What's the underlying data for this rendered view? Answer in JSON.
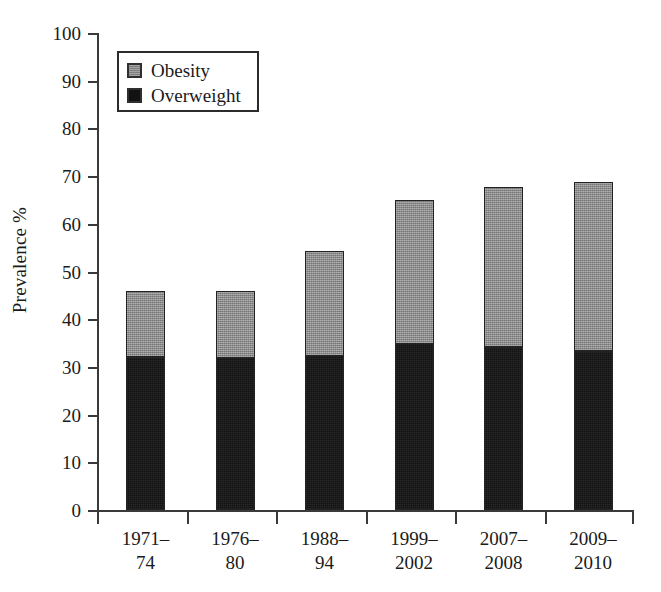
{
  "chart_data": {
    "type": "bar",
    "subtype": "stacked-vertical",
    "title": "",
    "xlabel": "",
    "ylabel": "Prevalence %",
    "ylim": [
      0,
      100
    ],
    "ytick_step": 10,
    "ytick_labels": [
      "0",
      "10",
      "20",
      "30",
      "40",
      "50",
      "60",
      "70",
      "80",
      "90",
      "100"
    ],
    "ytick_values": [
      0,
      10,
      20,
      30,
      40,
      50,
      60,
      70,
      80,
      90,
      100
    ],
    "grid": false,
    "legend_position": "top-left",
    "categories": [
      {
        "line1": "1971–",
        "line2": "74",
        "full": "1971–74"
      },
      {
        "line1": "1976–",
        "line2": "80",
        "full": "1976–80"
      },
      {
        "line1": "1988–",
        "line2": "94",
        "full": "1988–94"
      },
      {
        "line1": "1999–",
        "line2": "2002",
        "full": "1999–2002"
      },
      {
        "line1": "2007–",
        "line2": "2008",
        "full": "2007–2008"
      },
      {
        "line1": "2009–",
        "line2": "2010",
        "full": "2009–2010"
      }
    ],
    "series": [
      {
        "name": "Overweight",
        "color": "#121212",
        "stack_order": 0,
        "values": [
          32.0,
          31.8,
          32.2,
          34.8,
          34.2,
          33.3
        ]
      },
      {
        "name": "Obesity",
        "color": "#8c8c8c",
        "stack_order": 1,
        "values": [
          14.0,
          14.2,
          22.1,
          30.2,
          33.6,
          35.5
        ]
      }
    ],
    "stacked_totals": [
      46.0,
      46.0,
      54.3,
      65.0,
      67.8,
      68.8
    ]
  },
  "legend": {
    "entries": [
      {
        "label": "Obesity",
        "swatch": "obesity"
      },
      {
        "label": "Overweight",
        "swatch": "overweight"
      }
    ]
  },
  "axes": {
    "y_label": "Prevalence %"
  }
}
